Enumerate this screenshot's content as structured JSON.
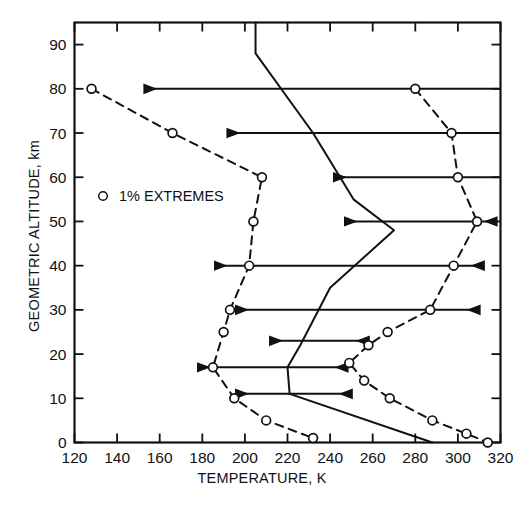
{
  "figure": {
    "top_note": "",
    "background": "#ffffff",
    "line_color": "#111111"
  },
  "legend": {
    "marker_icon": "open-circle-marker",
    "label": "1% EXTREMES"
  },
  "axes": {
    "x": {
      "title": "TEMPERATURE, K",
      "min": 120,
      "max": 320,
      "tick_step": 20,
      "ticks": [
        120,
        140,
        160,
        180,
        200,
        220,
        240,
        260,
        280,
        300,
        320
      ],
      "tick_labels": [
        "120",
        "140",
        "160",
        "180",
        "200",
        "220",
        "240",
        "260",
        "280",
        "300",
        "320"
      ]
    },
    "y": {
      "title": "GEOMETRIC ALTITUDE, km",
      "min": 0,
      "max": 95,
      "tick_step": 10,
      "ticks": [
        0,
        10,
        20,
        30,
        40,
        50,
        60,
        70,
        80,
        90
      ],
      "tick_labels": [
        "0",
        "10",
        "20",
        "30",
        "40",
        "50",
        "60",
        "70",
        "80",
        "90"
      ]
    }
  },
  "chart_data": {
    "type": "line",
    "title": "",
    "subtitle": "",
    "xlabel": "TEMPERATURE, K",
    "ylabel": "GEOMETRIC ALTITUDE, km",
    "xlim": [
      120,
      320
    ],
    "ylim": [
      0,
      95
    ],
    "grid": false,
    "legend_position": "upper-left-inside",
    "series": [
      {
        "name": "1% EXTREMES (cold)",
        "style": "dashed",
        "marker": "open-circle",
        "points": [
          {
            "t": 128,
            "z": 80
          },
          {
            "t": 166,
            "z": 70
          },
          {
            "t": 208,
            "z": 60
          },
          {
            "t": 204,
            "z": 50
          },
          {
            "t": 202,
            "z": 40
          },
          {
            "t": 193,
            "z": 30
          },
          {
            "t": 190,
            "z": 25
          },
          {
            "t": 185,
            "z": 17
          },
          {
            "t": 195,
            "z": 10
          },
          {
            "t": 210,
            "z": 5
          },
          {
            "t": 232,
            "z": 1
          }
        ]
      },
      {
        "name": "1% EXTREMES (warm)",
        "style": "dashed",
        "marker": "open-circle",
        "points": [
          {
            "t": 280,
            "z": 80
          },
          {
            "t": 297,
            "z": 70
          },
          {
            "t": 300,
            "z": 60
          },
          {
            "t": 309,
            "z": 50
          },
          {
            "t": 298,
            "z": 40
          },
          {
            "t": 287,
            "z": 30
          },
          {
            "t": 267,
            "z": 25
          },
          {
            "t": 258,
            "z": 22
          },
          {
            "t": 249,
            "z": 18
          },
          {
            "t": 256,
            "z": 14
          },
          {
            "t": 268,
            "z": 10
          },
          {
            "t": 288,
            "z": 5
          },
          {
            "t": 304,
            "z": 2
          },
          {
            "t": 314,
            "z": 0
          }
        ]
      },
      {
        "name": "U.S. Standard Atmosphere (mean)",
        "style": "solid",
        "marker": "none",
        "points": [
          {
            "t": 205,
            "z": 95
          },
          {
            "t": 205,
            "z": 88
          },
          {
            "t": 232,
            "z": 70
          },
          {
            "t": 251,
            "z": 55
          },
          {
            "t": 270,
            "z": 48
          },
          {
            "t": 240,
            "z": 35
          },
          {
            "t": 226,
            "z": 22
          },
          {
            "t": 220,
            "z": 17
          },
          {
            "t": 221,
            "z": 11
          },
          {
            "t": 288,
            "z": 0
          }
        ]
      }
    ],
    "range_bars": [
      {
        "z": 80,
        "t_low": 153,
        "t_high": 355,
        "arrows": "both"
      },
      {
        "z": 70,
        "t_low": 192,
        "t_high": 320,
        "arrows": "both"
      },
      {
        "z": 60,
        "t_low": 242,
        "t_high": 322,
        "arrows": "both"
      },
      {
        "z": 50,
        "t_low": 247,
        "t_high": 318,
        "arrows": "both"
      },
      {
        "z": 40,
        "t_low": 186,
        "t_high": 312,
        "arrows": "both"
      },
      {
        "z": 30,
        "t_low": 196,
        "t_high": 310,
        "arrows": "both"
      },
      {
        "z": 23,
        "t_low": 212,
        "t_high": 258,
        "arrows": "both"
      },
      {
        "z": 17,
        "t_low": 178,
        "t_high": 248,
        "arrows": "both"
      },
      {
        "z": 11,
        "t_low": 196,
        "t_high": 250,
        "arrows": "both"
      }
    ]
  }
}
